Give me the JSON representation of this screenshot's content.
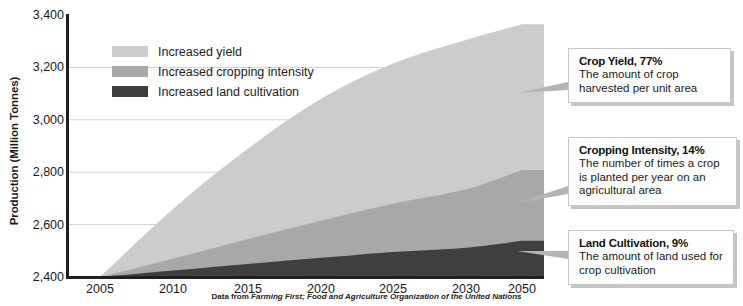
{
  "chart_data": {
    "type": "area",
    "title": "",
    "subtitle": "",
    "xlabel": "",
    "ylabel": "Production (Million Tonnes)",
    "x_tick_labels": [
      "2005",
      "2010",
      "2015",
      "2020",
      "2025",
      "2030",
      "2050"
    ],
    "y_tick_labels": [
      "3,400",
      "3,200",
      "3,000",
      "2,800",
      "2,600",
      "2,400"
    ],
    "ylim": [
      2400,
      3400
    ],
    "y_ticks": [
      2400,
      2600,
      2800,
      3000,
      3200,
      3400
    ],
    "grid": true,
    "stacked": true,
    "legend_position": "inside-top-left",
    "x": [
      2005,
      2010,
      2015,
      2020,
      2025,
      2030,
      2050
    ],
    "series": [
      {
        "name": "Increased land cultivation",
        "color": "#3f3f3f",
        "share_percent": 9,
        "cumulative_values": [
          2400,
          2425,
          2450,
          2473,
          2495,
          2512,
          2538
        ]
      },
      {
        "name": "Increased cropping intensity",
        "color": "#a8a8a8",
        "share_percent": 14,
        "cumulative_values": [
          2400,
          2470,
          2545,
          2615,
          2680,
          2735,
          2808
        ]
      },
      {
        "name": "Increased yield",
        "color": "#cccccc",
        "share_percent": 77,
        "cumulative_values": [
          2400,
          2660,
          2890,
          3080,
          3215,
          3305,
          3365
        ]
      }
    ],
    "source_note_prefix": "Data from ",
    "source_note_emphasis": "Farming First; Food and Agriculture Organization of the United Nations"
  },
  "axes": {
    "y_title": "Production (Million Tonnes)"
  },
  "legend": {
    "items": [
      {
        "label": "Increased yield",
        "color": "#cdcdcd"
      },
      {
        "label": "Increased cropping intensity",
        "color": "#a9a9a9"
      },
      {
        "label": "Increased land cultivation",
        "color": "#3d3d3d"
      }
    ]
  },
  "callouts": [
    {
      "id": "crop-yield",
      "title": "Crop Yield, 77%",
      "line1": "The amount of crop",
      "line2": "harvested per unit area",
      "line3": ""
    },
    {
      "id": "cropping-intensity",
      "title": "Cropping Intensity, 14%",
      "line1": "The number of times a crop",
      "line2": "is planted per year on an",
      "line3": "agricultural area"
    },
    {
      "id": "land-cultivation",
      "title": "Land Cultivation, 9%",
      "line1": "The amount of land used for",
      "line2": "crop cultivation",
      "line3": ""
    }
  ],
  "source": {
    "prefix": "Data from ",
    "emphasis": "Farming First; Food and Agriculture Organization of the United Nations"
  }
}
